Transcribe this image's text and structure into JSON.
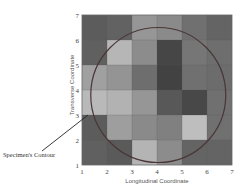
{
  "chart_data": {
    "type": "heatmap",
    "title": "",
    "xlabel": "Longitudinal Coordinate",
    "ylabel": "Transverse Coordinate",
    "xlim": [
      1,
      7
    ],
    "ylim": [
      1,
      7
    ],
    "x_ticks": [
      "1",
      "2",
      "3",
      "4",
      "5",
      "6",
      "7"
    ],
    "y_ticks": [
      "1",
      "2",
      "3",
      "4",
      "5",
      "6",
      "7"
    ],
    "grid": true,
    "colormap": "grayscale (higher value = lighter)",
    "value_scale": "relative gray intensity 0-255",
    "rows_top_to_bottom": [
      {
        "y_range": "6-7",
        "values": [
          92,
          98,
          150,
          138,
          112,
          100
        ]
      },
      {
        "y_range": "5-6",
        "values": [
          96,
          182,
          140,
          70,
          118,
          110
        ]
      },
      {
        "y_range": "4-5",
        "values": [
          160,
          148,
          110,
          66,
          112,
          108
        ]
      },
      {
        "y_range": "3-4",
        "values": [
          185,
          178,
          150,
          88,
          72,
          112
        ]
      },
      {
        "y_range": "2-3",
        "values": [
          92,
          158,
          138,
          128,
          190,
          112
        ]
      },
      {
        "y_range": "1-2",
        "values": [
          96,
          90,
          180,
          140,
          100,
          100
        ]
      }
    ],
    "overlay": {
      "shape": "circle",
      "label": "Specimen's Contour",
      "center_data": [
        4.05,
        3.8
      ],
      "radius_data": 2.7,
      "color": "#4a3636"
    },
    "annotations": [
      {
        "text": "Specimen's Contour",
        "points_to": "circle edge near (1.2, 3.0)"
      }
    ]
  },
  "labels": {
    "x_axis": "Longitudinal Coordinate",
    "y_axis": "Transverse Coordinate",
    "annotation": "Specimen's Contour"
  },
  "colors": {
    "background": "#ffffff",
    "grid_line": "#555555",
    "contour": "#4a3636",
    "leader_line": "#222222",
    "text": "#444444"
  }
}
